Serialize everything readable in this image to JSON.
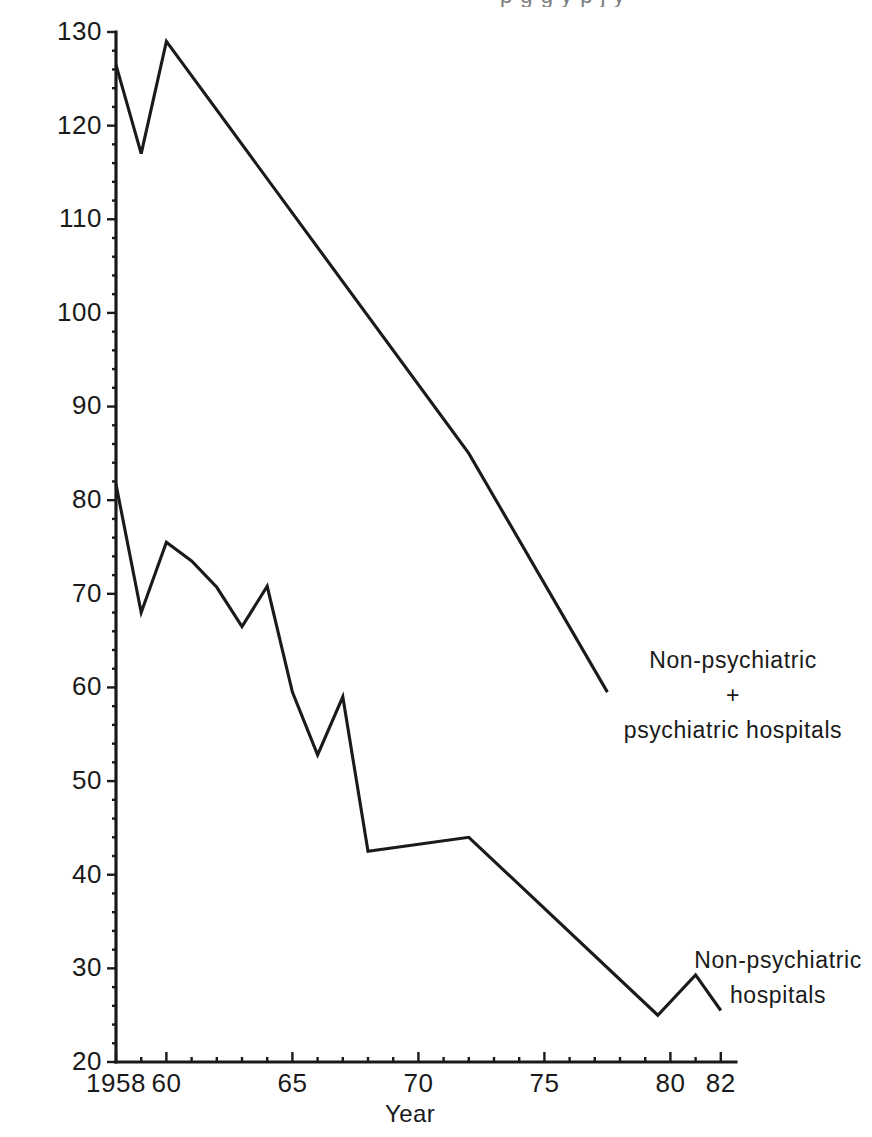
{
  "chart_data": {
    "type": "line",
    "title": "",
    "xlabel": "Year",
    "ylabel": "",
    "xlim": [
      1957.2,
      1982.6
    ],
    "ylim": [
      20,
      130
    ],
    "grid": false,
    "legend_position": "inline-annotations",
    "x_tick_values": [
      1958,
      1960,
      1965,
      1970,
      1975,
      1980,
      1982
    ],
    "x_tick_labels": [
      "1958",
      "60",
      "65",
      "70",
      "75",
      "80",
      "82"
    ],
    "x_minor_ticks": [
      1959,
      1961,
      1962,
      1963,
      1964,
      1966,
      1967,
      1968,
      1969,
      1971,
      1972,
      1973,
      1974,
      1976,
      1977,
      1978,
      1979,
      1981
    ],
    "y_tick_values": [
      20,
      30,
      40,
      50,
      60,
      70,
      80,
      90,
      100,
      110,
      120,
      130
    ],
    "y_tick_labels": [
      "20",
      "30",
      "40",
      "50",
      "60",
      "70",
      "80",
      "90",
      "100",
      "110",
      "120",
      "130"
    ],
    "series": [
      {
        "name": "Non-psychiatric + psychiatric hospitals",
        "x": [
          1958,
          1959,
          1960,
          1972,
          1977.5
        ],
        "values": [
          126.5,
          117.0,
          129.0,
          85.0,
          59.5
        ]
      },
      {
        "name": "Non-psychiatric hospitals",
        "x": [
          1958,
          1959,
          1960,
          1961,
          1962,
          1963,
          1964,
          1965,
          1966,
          1967,
          1968,
          1972,
          1979.5,
          1981,
          1982
        ],
        "values": [
          81.7,
          68.0,
          75.5,
          73.5,
          70.7,
          66.5,
          70.8,
          59.5,
          52.8,
          59.0,
          42.5,
          44.0,
          25.0,
          29.3,
          25.5
        ]
      }
    ],
    "annotations": [
      {
        "id": "upper-series-label",
        "lines": [
          "Non-psychiatric",
          "+",
          "psychiatric hospitals"
        ],
        "x": 733,
        "y": 668
      },
      {
        "id": "lower-series-label",
        "lines": [
          "Non-psychiatric",
          "hospitals"
        ],
        "x": 778,
        "y": 968
      }
    ],
    "colors": {
      "line": "#1a1a1a",
      "axis": "#1a1a1a",
      "background": "#ffffff",
      "text": "#1a1a1a"
    }
  },
  "top_cropped_text": "p g g y p j y"
}
